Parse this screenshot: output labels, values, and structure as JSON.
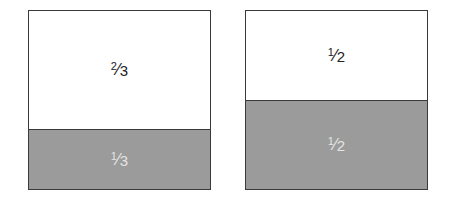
{
  "figures": [
    {
      "name": "thirds-square",
      "parts": [
        {
          "label_num": "2",
          "label_den": "3",
          "fraction": "2/3",
          "shaded": false
        },
        {
          "label_num": "1",
          "label_den": "3",
          "fraction": "1/3",
          "shaded": true
        }
      ]
    },
    {
      "name": "halves-square",
      "parts": [
        {
          "label_num": "1",
          "label_den": "2",
          "fraction": "1/2",
          "shaded": false
        },
        {
          "label_num": "1",
          "label_den": "2",
          "fraction": "1/2",
          "shaded": true
        }
      ]
    }
  ],
  "colors": {
    "shaded": "#9b9b9b",
    "border": "#3a3a3a",
    "background": "#ffffff"
  }
}
